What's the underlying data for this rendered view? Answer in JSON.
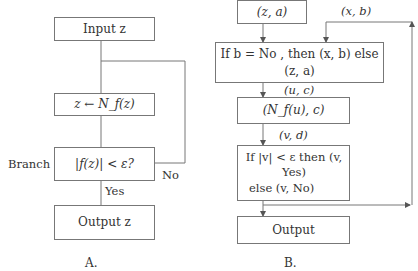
{
  "diagram_a": {
    "caption": "A.",
    "input_box": "Input z",
    "update_box": "z ← N_f(z)",
    "branch_box": "|f(z)| < ε?",
    "branch_label": "Branch",
    "yes_label": "Yes",
    "no_label": "No",
    "output_box": "Output z"
  },
  "diagram_b": {
    "caption": "B.",
    "input_box": "(z, a)",
    "feedback_label": "(x, b)",
    "select_box": "If b = No ,  then (x, b) else (z, a)",
    "edge_uc": "(u, c)",
    "newton_box": "(N_f(u), c)",
    "edge_vd": "(v, d)",
    "test_box_line1": "If |v| < ε  then (v, Yes)",
    "test_box_line2": "else (v, No)",
    "output_box": "Output"
  }
}
